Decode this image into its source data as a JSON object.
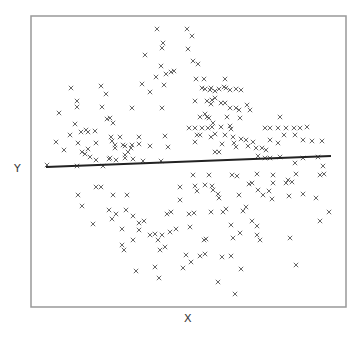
{
  "chart_data": {
    "type": "scatter",
    "title": "",
    "xlabel": "X",
    "ylabel": "Y",
    "xlim": [
      0,
      315
    ],
    "ylim": [
      0,
      291
    ],
    "grid": false,
    "legend": null,
    "ticks": {
      "x": [],
      "y": []
    },
    "marker": "x",
    "marker_color": "#555555",
    "frame_color": "#999999",
    "series": [
      {
        "name": "points",
        "points": [
          [
            126,
            278
          ],
          [
            132,
            264
          ],
          [
            131,
            259
          ],
          [
            114,
            252
          ],
          [
            130,
            241
          ],
          [
            125,
            230
          ],
          [
            140,
            235
          ],
          [
            143,
            236
          ],
          [
            135,
            233
          ],
          [
            111,
            223
          ],
          [
            133,
            222
          ],
          [
            119,
            215
          ],
          [
            40,
            219
          ],
          [
            70,
            221
          ],
          [
            75,
            213
          ],
          [
            46,
            206
          ],
          [
            46,
            200
          ],
          [
            71,
            200
          ],
          [
            101,
            199
          ],
          [
            131,
            199
          ],
          [
            28,
            194
          ],
          [
            76,
            188
          ],
          [
            79,
            189
          ],
          [
            82,
            184
          ],
          [
            44,
            183
          ],
          [
            39,
            172
          ],
          [
            50,
            175
          ],
          [
            55,
            177
          ],
          [
            57,
            175
          ],
          [
            64,
            176
          ],
          [
            80,
            170
          ],
          [
            89,
            170
          ],
          [
            108,
            170
          ],
          [
            134,
            171
          ],
          [
            25,
            165
          ],
          [
            47,
            164
          ],
          [
            65,
            164
          ],
          [
            81,
            166
          ],
          [
            84,
            162
          ],
          [
            94,
            161
          ],
          [
            101,
            162
          ],
          [
            108,
            163
          ],
          [
            119,
            161
          ],
          [
            33,
            157
          ],
          [
            51,
            155
          ],
          [
            57,
            158
          ],
          [
            84,
            159
          ],
          [
            92,
            162
          ],
          [
            100,
            159
          ],
          [
            137,
            160
          ],
          [
            79,
            149
          ],
          [
            94,
            152
          ],
          [
            97,
            155
          ],
          [
            54,
            153
          ],
          [
            59,
            150
          ],
          [
            94,
            149
          ],
          [
            112,
            146
          ],
          [
            65,
            147
          ],
          [
            78,
            148
          ],
          [
            85,
            147
          ],
          [
            102,
            148
          ],
          [
            130,
            146
          ],
          [
            16,
            142
          ],
          [
            46,
            141
          ],
          [
            72,
            141
          ],
          [
            156,
            278
          ],
          [
            161,
            271
          ],
          [
            157,
            258
          ],
          [
            162,
            246
          ],
          [
            167,
            243
          ],
          [
            165,
            228
          ],
          [
            173,
            228
          ],
          [
            174,
            218
          ],
          [
            171,
            219
          ],
          [
            194,
            228
          ],
          [
            179,
            217
          ],
          [
            180,
            219
          ],
          [
            184,
            216
          ],
          [
            188,
            218
          ],
          [
            193,
            220
          ],
          [
            195,
            219
          ],
          [
            199,
            217
          ],
          [
            205,
            218
          ],
          [
            210,
            217
          ],
          [
            164,
            206
          ],
          [
            176,
            206
          ],
          [
            181,
            207
          ],
          [
            184,
            209
          ],
          [
            180,
            203
          ],
          [
            190,
            204
          ],
          [
            194,
            204
          ],
          [
            199,
            199
          ],
          [
            205,
            199
          ],
          [
            208,
            197
          ],
          [
            216,
            202
          ],
          [
            219,
            197
          ],
          [
            169,
            190
          ],
          [
            174,
            193
          ],
          [
            178,
            189
          ],
          [
            182,
            184
          ],
          [
            190,
            180
          ],
          [
            199,
            181
          ],
          [
            209,
            189
          ],
          [
            158,
            179
          ],
          [
            164,
            179
          ],
          [
            171,
            179
          ],
          [
            177,
            179
          ],
          [
            181,
            180
          ],
          [
            176,
            190
          ],
          [
            196,
            190
          ],
          [
            249,
            190
          ],
          [
            166,
            172
          ],
          [
            164,
            165
          ],
          [
            169,
            172
          ],
          [
            180,
            170
          ],
          [
            184,
            173
          ],
          [
            194,
            172
          ],
          [
            200,
            178
          ],
          [
            202,
            170
          ],
          [
            234,
            179
          ],
          [
            239,
            179
          ],
          [
            247,
            179
          ],
          [
            255,
            179
          ],
          [
            263,
            179
          ],
          [
            269,
            179
          ],
          [
            276,
            180
          ],
          [
            253,
            172
          ],
          [
            264,
            172
          ],
          [
            272,
            167
          ],
          [
            281,
            166
          ],
          [
            184,
            155
          ],
          [
            188,
            155
          ],
          [
            191,
            163
          ],
          [
            203,
            164
          ],
          [
            205,
            160
          ],
          [
            210,
            168
          ],
          [
            215,
            167
          ],
          [
            217,
            161
          ],
          [
            222,
            165
          ],
          [
            225,
            159
          ],
          [
            231,
            159
          ],
          [
            239,
            167
          ],
          [
            235,
            157
          ],
          [
            247,
            164
          ],
          [
            272,
            149
          ],
          [
            234,
            149
          ],
          [
            239,
            149
          ],
          [
            291,
            166
          ],
          [
            292,
            141
          ],
          [
            287,
            150
          ],
          [
            249,
            150
          ],
          [
            227,
            151
          ],
          [
            264,
            144
          ],
          [
            47,
            112
          ],
          [
            51,
            101
          ],
          [
            65,
            120
          ],
          [
            70,
            120
          ],
          [
            82,
            112
          ],
          [
            78,
            97
          ],
          [
            81,
            88
          ],
          [
            62,
            83
          ],
          [
            85,
            93
          ],
          [
            96,
            112
          ],
          [
            95,
            97
          ],
          [
            102,
            91
          ],
          [
            108,
            84
          ],
          [
            108,
            77
          ],
          [
            91,
            78
          ],
          [
            113,
            86
          ],
          [
            91,
            62
          ],
          [
            93,
            57
          ],
          [
            102,
            67
          ],
          [
            105,
            36
          ],
          [
            124,
            40
          ],
          [
            128,
            29
          ],
          [
            119,
            72
          ],
          [
            124,
            73
          ],
          [
            127,
            67
          ],
          [
            131,
            72
          ],
          [
            129,
            57
          ],
          [
            134,
            60
          ],
          [
            139,
            75
          ],
          [
            145,
            78
          ],
          [
            136,
            93
          ],
          [
            140,
            95
          ],
          [
            149,
            120
          ],
          [
            149,
            107
          ],
          [
            162,
            132
          ],
          [
            178,
            132
          ],
          [
            201,
            132
          ],
          [
            206,
            131
          ],
          [
            164,
            121
          ],
          [
            174,
            122
          ],
          [
            181,
            121
          ],
          [
            182,
            117
          ],
          [
            187,
            113
          ],
          [
            226,
            133
          ],
          [
            242,
            132
          ],
          [
            265,
            133
          ],
          [
            289,
            132
          ],
          [
            293,
            133
          ],
          [
            218,
            123
          ],
          [
            221,
            124
          ],
          [
            242,
            124
          ],
          [
            257,
            127
          ],
          [
            261,
            125
          ],
          [
            166,
            116
          ],
          [
            188,
            109
          ],
          [
            208,
            112
          ],
          [
            227,
            117
          ],
          [
            238,
            116
          ],
          [
            241,
            108
          ],
          [
            258,
            111
          ],
          [
            232,
            112
          ],
          [
            255,
            124
          ],
          [
            272,
            113
          ],
          [
            285,
            109
          ],
          [
            180,
            95
          ],
          [
            192,
            95
          ],
          [
            195,
            98
          ],
          [
            158,
            93
          ],
          [
            163,
            94
          ],
          [
            200,
            82
          ],
          [
            212,
            96
          ],
          [
            215,
            100
          ],
          [
            221,
            86
          ],
          [
            226,
            81
          ],
          [
            209,
            74
          ],
          [
            229,
            67
          ],
          [
            202,
            69
          ],
          [
            173,
            67
          ],
          [
            159,
            80
          ],
          [
            175,
            68
          ],
          [
            155,
            52
          ],
          [
            160,
            45
          ],
          [
            169,
            51
          ],
          [
            174,
            53
          ],
          [
            191,
            50
          ],
          [
            200,
            51
          ],
          [
            152,
            39
          ],
          [
            187,
            25
          ],
          [
            210,
            38
          ],
          [
            204,
            13
          ],
          [
            298,
            95
          ],
          [
            259,
            69
          ],
          [
            289,
            86
          ],
          [
            226,
            72
          ],
          [
            265,
            42
          ]
        ]
      }
    ],
    "regression_line": {
      "color": "#222222",
      "start": [
        15,
        140
      ],
      "end": [
        300,
        151
      ]
    }
  },
  "labels": {
    "x": "X",
    "y": "Y"
  }
}
